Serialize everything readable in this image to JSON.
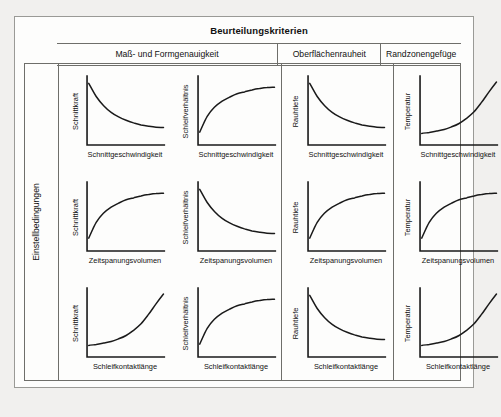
{
  "header": {
    "title": "Beurteilungskriterien",
    "columns": [
      {
        "label": "Maß- und Formgenauigkeit"
      },
      {
        "label": "Oberflächenrauheit"
      },
      {
        "label": "Randzonengefüge"
      }
    ]
  },
  "side": {
    "label": "Einstellbedingungen"
  },
  "chart_data": [
    {
      "type": "line",
      "title": "Schnittkraft vs Schnittgeschwindigkeit",
      "ylabel": "Schnittkraft",
      "xlabel": "Schnittgeschwindigkeit",
      "shape": "decay",
      "x": [
        0,
        0.1,
        0.2,
        0.3,
        0.4,
        0.5,
        0.6,
        0.7,
        0.8,
        0.9,
        1.0
      ],
      "values": [
        0.92,
        0.72,
        0.58,
        0.48,
        0.41,
        0.36,
        0.32,
        0.29,
        0.27,
        0.255,
        0.25
      ],
      "xlim": [
        0,
        1
      ],
      "ylim": [
        0,
        1
      ],
      "grid": false
    },
    {
      "type": "line",
      "title": "Schleifverhältnis vs Schnittgeschwindigkeit",
      "ylabel": "Schleifverhältnis",
      "xlabel": "Schnittgeschwindigkeit",
      "shape": "saturating-rise",
      "x": [
        0,
        0.1,
        0.2,
        0.3,
        0.4,
        0.5,
        0.6,
        0.7,
        0.8,
        0.9,
        1.0
      ],
      "values": [
        0.18,
        0.42,
        0.56,
        0.65,
        0.71,
        0.76,
        0.79,
        0.82,
        0.84,
        0.855,
        0.86
      ],
      "xlim": [
        0,
        1
      ],
      "ylim": [
        0,
        1
      ],
      "grid": false
    },
    {
      "type": "line",
      "title": "Rauhtiefe vs Schnittgeschwindigkeit",
      "ylabel": "Rauhtiefe",
      "xlabel": "Schnittgeschwindigkeit",
      "shape": "decay",
      "x": [
        0,
        0.1,
        0.2,
        0.3,
        0.4,
        0.5,
        0.6,
        0.7,
        0.8,
        0.9,
        1.0
      ],
      "values": [
        0.92,
        0.72,
        0.58,
        0.48,
        0.41,
        0.36,
        0.32,
        0.29,
        0.27,
        0.255,
        0.25
      ],
      "xlim": [
        0,
        1
      ],
      "ylim": [
        0,
        1
      ],
      "grid": false
    },
    {
      "type": "line",
      "title": "Temperatur vs Schnittgeschwindigkeit",
      "ylabel": "Temperatur",
      "xlabel": "Schnittgeschwindigkeit",
      "shape": "exponential-rise",
      "x": [
        0,
        0.1,
        0.2,
        0.3,
        0.4,
        0.5,
        0.6,
        0.7,
        0.8,
        0.9,
        1.0
      ],
      "values": [
        0.16,
        0.175,
        0.195,
        0.22,
        0.26,
        0.31,
        0.39,
        0.49,
        0.63,
        0.79,
        0.94
      ],
      "xlim": [
        0,
        1
      ],
      "ylim": [
        0,
        1
      ],
      "grid": false
    },
    {
      "type": "line",
      "title": "Schnittkraft vs Zeitspanungsvolumen",
      "ylabel": "Schnittkraft",
      "xlabel": "Zeitspanungsvolumen",
      "shape": "saturating-rise",
      "x": [
        0,
        0.1,
        0.2,
        0.3,
        0.4,
        0.5,
        0.6,
        0.7,
        0.8,
        0.9,
        1.0
      ],
      "values": [
        0.18,
        0.42,
        0.56,
        0.65,
        0.71,
        0.76,
        0.79,
        0.82,
        0.84,
        0.855,
        0.86
      ],
      "xlim": [
        0,
        1
      ],
      "ylim": [
        0,
        1
      ],
      "grid": false
    },
    {
      "type": "line",
      "title": "Schleifverhältnis vs Zeitspanungsvolumen",
      "ylabel": "Schleifverhältnis",
      "xlabel": "Zeitspanungsvolumen",
      "shape": "decay",
      "x": [
        0,
        0.1,
        0.2,
        0.3,
        0.4,
        0.5,
        0.6,
        0.7,
        0.8,
        0.9,
        1.0
      ],
      "values": [
        0.92,
        0.72,
        0.58,
        0.48,
        0.41,
        0.36,
        0.32,
        0.29,
        0.27,
        0.255,
        0.25
      ],
      "xlim": [
        0,
        1
      ],
      "ylim": [
        0,
        1
      ],
      "grid": false
    },
    {
      "type": "line",
      "title": "Rauhtiefe vs Zeitspanungsvolumen",
      "ylabel": "Rauhtiefe",
      "xlabel": "Zeitspanungsvolumen",
      "shape": "saturating-rise",
      "x": [
        0,
        0.1,
        0.2,
        0.3,
        0.4,
        0.5,
        0.6,
        0.7,
        0.8,
        0.9,
        1.0
      ],
      "values": [
        0.18,
        0.42,
        0.56,
        0.65,
        0.71,
        0.76,
        0.79,
        0.82,
        0.84,
        0.855,
        0.86
      ],
      "xlim": [
        0,
        1
      ],
      "ylim": [
        0,
        1
      ],
      "grid": false
    },
    {
      "type": "line",
      "title": "Temperatur vs Zeitspanungsvolumen",
      "ylabel": "Temperatur",
      "xlabel": "Zeitspanungsvolumen",
      "shape": "saturating-rise",
      "x": [
        0,
        0.1,
        0.2,
        0.3,
        0.4,
        0.5,
        0.6,
        0.7,
        0.8,
        0.9,
        1.0
      ],
      "values": [
        0.18,
        0.42,
        0.56,
        0.65,
        0.71,
        0.76,
        0.79,
        0.82,
        0.84,
        0.855,
        0.86
      ],
      "xlim": [
        0,
        1
      ],
      "ylim": [
        0,
        1
      ],
      "grid": false
    },
    {
      "type": "line",
      "title": "Schnittkraft vs Schleifkontaktlänge",
      "ylabel": "Schnittkraft",
      "xlabel": "Schleifkontaktlänge",
      "shape": "exponential-rise",
      "x": [
        0,
        0.1,
        0.2,
        0.3,
        0.4,
        0.5,
        0.6,
        0.7,
        0.8,
        0.9,
        1.0
      ],
      "values": [
        0.16,
        0.175,
        0.195,
        0.22,
        0.26,
        0.31,
        0.39,
        0.49,
        0.63,
        0.79,
        0.94
      ],
      "xlim": [
        0,
        1
      ],
      "ylim": [
        0,
        1
      ],
      "grid": false
    },
    {
      "type": "line",
      "title": "Schleifverhältnis vs Schleifkontaktlänge",
      "ylabel": "Schleifverhältnis",
      "xlabel": "Schleifkontaktlänge",
      "shape": "saturating-rise",
      "x": [
        0,
        0.1,
        0.2,
        0.3,
        0.4,
        0.5,
        0.6,
        0.7,
        0.8,
        0.9,
        1.0
      ],
      "values": [
        0.18,
        0.42,
        0.56,
        0.65,
        0.71,
        0.76,
        0.79,
        0.82,
        0.84,
        0.855,
        0.86
      ],
      "xlim": [
        0,
        1
      ],
      "ylim": [
        0,
        1
      ],
      "grid": false
    },
    {
      "type": "line",
      "title": "Rauhtiefe vs Schleifkontaktlänge",
      "ylabel": "Rauhtiefe",
      "xlabel": "Schleifkontaktlänge",
      "shape": "decay",
      "x": [
        0,
        0.1,
        0.2,
        0.3,
        0.4,
        0.5,
        0.6,
        0.7,
        0.8,
        0.9,
        1.0
      ],
      "values": [
        0.92,
        0.72,
        0.58,
        0.48,
        0.41,
        0.36,
        0.32,
        0.29,
        0.27,
        0.255,
        0.25
      ],
      "xlim": [
        0,
        1
      ],
      "ylim": [
        0,
        1
      ],
      "grid": false
    },
    {
      "type": "line",
      "title": "Temperatur vs Schleifkontaktlänge",
      "ylabel": "Temperatur",
      "xlabel": "Schleifkontaktlänge",
      "shape": "exponential-rise",
      "x": [
        0,
        0.1,
        0.2,
        0.3,
        0.4,
        0.5,
        0.6,
        0.7,
        0.8,
        0.9,
        1.0
      ],
      "values": [
        0.16,
        0.175,
        0.195,
        0.22,
        0.26,
        0.31,
        0.39,
        0.49,
        0.63,
        0.79,
        0.94
      ],
      "xlim": [
        0,
        1
      ],
      "ylim": [
        0,
        1
      ],
      "grid": false
    }
  ],
  "colors": {
    "frame": "#6e6e6a",
    "curve": "#1a1a1a",
    "panel": "#fdfdfc",
    "background": "#f1f0ee"
  }
}
